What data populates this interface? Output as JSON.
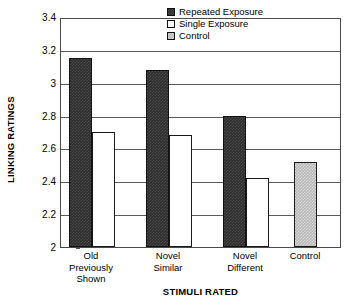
{
  "chart_data": {
    "type": "bar",
    "title": "",
    "xlabel": "STIMULI RATED",
    "ylabel": "LINKING RATINGS",
    "ylim": [
      2,
      3.4
    ],
    "yticks": [
      2,
      2.2,
      2.4,
      2.6,
      2.8,
      3,
      3.2,
      3.4
    ],
    "ytick_labels": [
      "2",
      "2.2",
      "2.4",
      "2.6",
      "2.8",
      "3",
      "3.2",
      "3.4"
    ],
    "grid": true,
    "legend_position": "top-right",
    "categories": [
      "Old\nPreviously\nShown",
      "Novel\nSimilar",
      "Novel\nDifferent",
      "Control"
    ],
    "series": [
      {
        "name": "Repeated Exposure",
        "swatch": "repeated",
        "color": "#2b2b2b",
        "values": [
          3.15,
          3.08,
          2.8,
          null
        ]
      },
      {
        "name": "Single Exposure",
        "swatch": "single",
        "color": "#ffffff",
        "values": [
          2.7,
          2.68,
          2.42,
          null
        ]
      },
      {
        "name": "Control",
        "swatch": "control",
        "color": "#b6b6b6",
        "values": [
          null,
          null,
          null,
          2.52
        ]
      }
    ]
  },
  "axes": {
    "y_title": "LINKING RATINGS",
    "x_title": "STIMULI RATED",
    "y_ticks": [
      {
        "label": "3.4",
        "value": 3.4
      },
      {
        "label": "3.2",
        "value": 3.2
      },
      {
        "label": "3",
        "value": 3.0
      },
      {
        "label": "2.8",
        "value": 2.8
      },
      {
        "label": "2.6",
        "value": 2.6
      },
      {
        "label": "2.4",
        "value": 2.4
      },
      {
        "label": "2.2",
        "value": 2.2
      },
      {
        "label": "2",
        "value": 2.0
      }
    ],
    "x_ticks": [
      {
        "label": "Old\nPreviously\nShown"
      },
      {
        "label": "Novel\nSimilar"
      },
      {
        "label": "Novel\nDifferent"
      },
      {
        "label": "Control"
      }
    ]
  },
  "legend": {
    "items": [
      {
        "label": "Repeated Exposure",
        "swatch": "repeated"
      },
      {
        "label": "Single Exposure",
        "swatch": "single"
      },
      {
        "label": "Control",
        "swatch": "control"
      }
    ]
  },
  "bars": [
    {
      "name": "bar-old-repeated",
      "group": 0,
      "series": "Repeated Exposure",
      "swatch": "repeated",
      "value": 3.15,
      "left": 8,
      "width": 23
    },
    {
      "name": "bar-old-single",
      "group": 0,
      "series": "Single Exposure",
      "swatch": "single",
      "value": 2.7,
      "left": 31,
      "width": 23
    },
    {
      "name": "bar-novelsim-repeated",
      "group": 1,
      "series": "Repeated Exposure",
      "swatch": "repeated",
      "value": 3.08,
      "left": 85,
      "width": 23
    },
    {
      "name": "bar-novelsim-single",
      "group": 1,
      "series": "Single Exposure",
      "swatch": "single",
      "value": 2.68,
      "left": 108,
      "width": 23
    },
    {
      "name": "bar-noveldif-repeated",
      "group": 2,
      "series": "Repeated Exposure",
      "swatch": "repeated",
      "value": 2.8,
      "left": 162,
      "width": 23
    },
    {
      "name": "bar-noveldif-single",
      "group": 2,
      "series": "Single Exposure",
      "swatch": "single",
      "value": 2.42,
      "left": 185,
      "width": 23
    },
    {
      "name": "bar-control-control",
      "group": 3,
      "series": "Control",
      "swatch": "control",
      "value": 2.52,
      "left": 233,
      "width": 23
    }
  ],
  "layout": {
    "plot_left": 60,
    "plot_top": 18,
    "plot_width": 281,
    "plot_height": 230,
    "group_centers": [
      31,
      108,
      185,
      245
    ]
  }
}
